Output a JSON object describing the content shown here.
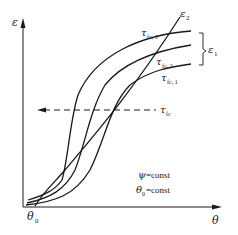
{
  "diagram": {
    "axes": {
      "y_label": "ε",
      "x_label": "θ",
      "origin_label": "θ",
      "origin_label_sub": "0"
    },
    "curves": [
      {
        "id": "tau_fc_3",
        "label": "τ",
        "sub": "fc, 3"
      },
      {
        "id": "tau_fc_2",
        "label": "τ",
        "sub": "fc, 2"
      },
      {
        "id": "tau_fc_1",
        "label": "τ",
        "sub": "fc, 1"
      }
    ],
    "line_epsilon2": {
      "label": "ε",
      "sub": "2"
    },
    "bracket": {
      "label": "ε",
      "sub": "1"
    },
    "dashed_line": {
      "label": "τ",
      "sub": "fc"
    },
    "conditions": [
      {
        "symbol": "ψ",
        "text": " =const"
      },
      {
        "symbol": "θ",
        "sub": "0",
        "text": " =const"
      }
    ],
    "colors": {
      "ink": "#1a1a1a",
      "background": "#ffffff"
    }
  }
}
